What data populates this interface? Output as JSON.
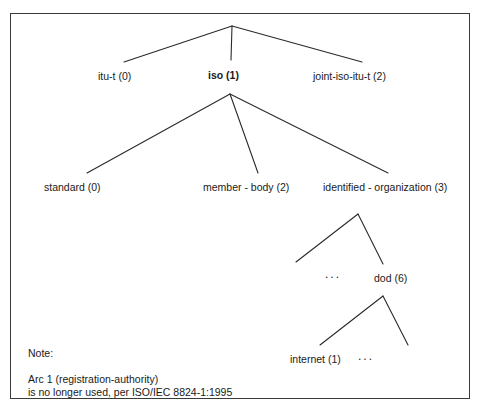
{
  "diagram": {
    "type": "tree",
    "border_color": "#3a3a3a",
    "line_color": "#2a2a2a",
    "background": "#ffffff",
    "root": {
      "label": "",
      "x": 232,
      "y": 26
    },
    "levels": [
      {
        "name": "top-level-arcs",
        "nodes": [
          {
            "id": "itu-t",
            "label": "itu-t (0)",
            "value": "0",
            "bold": false,
            "x": 98,
            "y": 70
          },
          {
            "id": "iso",
            "label": "iso (1)",
            "value": "1",
            "bold": true,
            "x": 208,
            "y": 69
          },
          {
            "id": "joint-iso-itu-t",
            "label": "joint-iso-itu-t (2)",
            "value": "2",
            "bold": false,
            "x": 313,
            "y": 70
          }
        ]
      },
      {
        "name": "iso-arcs",
        "nodes": [
          {
            "id": "standard",
            "label": "standard (0)",
            "value": "0",
            "bold": false,
            "x": 44,
            "y": 181
          },
          {
            "id": "member-body",
            "label": "member - body (2)",
            "value": "2",
            "bold": false,
            "x": 203,
            "y": 181
          },
          {
            "id": "identified-organization",
            "label": "identified - organization (3)",
            "value": "3",
            "bold": false,
            "x": 323,
            "y": 181
          }
        ]
      },
      {
        "name": "identified-organization-arcs",
        "nodes": [
          {
            "id": "dod",
            "label": "dod (6)",
            "value": "6",
            "bold": false,
            "x": 374,
            "y": 272
          }
        ],
        "ellipses": [
          {
            "id": "ellipsis-dod-left",
            "label": "...",
            "x": 325,
            "y": 268
          }
        ]
      },
      {
        "name": "dod-arcs",
        "nodes": [
          {
            "id": "internet",
            "label": "internet (1)",
            "value": "1",
            "bold": false,
            "x": 290,
            "y": 353
          }
        ],
        "ellipses": [
          {
            "id": "ellipsis-internet-right",
            "label": "...",
            "x": 358,
            "y": 350
          }
        ]
      }
    ],
    "edges": [
      {
        "from": "root",
        "to": "itu-t",
        "x1": 232,
        "y1": 26,
        "x2": 124,
        "y2": 62
      },
      {
        "from": "root",
        "to": "iso",
        "x1": 232,
        "y1": 26,
        "x2": 231,
        "y2": 60
      },
      {
        "from": "root",
        "to": "joint-iso-itu-t",
        "x1": 232,
        "y1": 26,
        "x2": 362,
        "y2": 62
      },
      {
        "from": "iso",
        "to": "standard",
        "x1": 230,
        "y1": 94,
        "x2": 87,
        "y2": 173
      },
      {
        "from": "iso",
        "to": "member-body",
        "x1": 230,
        "y1": 94,
        "x2": 258,
        "y2": 173
      },
      {
        "from": "iso",
        "to": "identified-organization",
        "x1": 230,
        "y1": 94,
        "x2": 388,
        "y2": 173
      },
      {
        "from": "identified-organization",
        "to": "ellipsis-dod-left",
        "x1": 358,
        "y1": 214,
        "x2": 296,
        "y2": 262
      },
      {
        "from": "identified-organization",
        "to": "dod",
        "x1": 358,
        "y1": 214,
        "x2": 383,
        "y2": 264
      },
      {
        "from": "dod",
        "to": "internet",
        "x1": 383,
        "y1": 296,
        "x2": 320,
        "y2": 345
      },
      {
        "from": "dod",
        "to": "ellipsis-internet-right",
        "x1": 383,
        "y1": 296,
        "x2": 408,
        "y2": 345
      }
    ]
  },
  "note": {
    "title": "Note:",
    "lines": [
      "Arc 1 (registration-authority)",
      "is no longer used, per ISO/IEC 8824-1:1995"
    ]
  }
}
